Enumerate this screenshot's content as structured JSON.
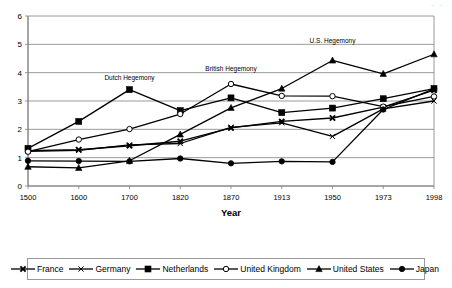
{
  "top_partial_text": "‥ ‥",
  "chart_data": {
    "type": "line",
    "title": "",
    "xlabel": "Year",
    "ylabel": "",
    "categories": [
      "1500",
      "1600",
      "1700",
      "1820",
      "1870",
      "1913",
      "1950",
      "1973",
      "1998"
    ],
    "ylim": [
      0,
      6
    ],
    "yticks": [
      "0",
      "1",
      "2",
      "3",
      "4",
      "5",
      "6"
    ],
    "grid": true,
    "legend_position": "bottom",
    "annotations": [
      {
        "text": "Dutch Hegemony",
        "x": "1700",
        "y": 3.75
      },
      {
        "text": "British Hegemony",
        "x": "1870",
        "y": 4.05
      },
      {
        "text": "U.S. Hegemony",
        "x": "1950",
        "y": 5.05
      }
    ],
    "series": [
      {
        "name": "France",
        "marker": "x-bold",
        "values": [
          1.25,
          1.28,
          1.42,
          1.58,
          2.05,
          2.28,
          2.4,
          2.78,
          3.38
        ]
      },
      {
        "name": "Germany",
        "marker": "x-thin",
        "values": [
          1.22,
          1.26,
          1.45,
          1.5,
          2.07,
          2.23,
          1.75,
          2.72,
          3.0
        ]
      },
      {
        "name": "Netherlands",
        "marker": "filled-square",
        "values": [
          1.33,
          2.28,
          3.4,
          2.66,
          3.11,
          2.59,
          2.75,
          3.08,
          3.44
        ]
      },
      {
        "name": "United Kingdom",
        "marker": "open-circle",
        "values": [
          1.21,
          1.64,
          2.01,
          2.54,
          3.6,
          3.18,
          3.17,
          2.8,
          3.16
        ]
      },
      {
        "name": "United States",
        "marker": "filled-triangle",
        "values": [
          0.68,
          0.64,
          0.89,
          1.82,
          2.76,
          3.44,
          4.43,
          3.96,
          4.65
        ]
      },
      {
        "name": "Japan",
        "marker": "filled-circle",
        "values": [
          0.89,
          0.88,
          0.87,
          0.97,
          0.8,
          0.87,
          0.85,
          2.7,
          3.43
        ]
      }
    ]
  },
  "legend": {
    "items": [
      {
        "label": "France",
        "marker": "x-bold"
      },
      {
        "label": "Germany",
        "marker": "x-thin"
      },
      {
        "label": "Netherlands",
        "marker": "filled-square"
      },
      {
        "label": "United Kingdom",
        "marker": "open-circle"
      },
      {
        "label": "United States",
        "marker": "filled-triangle"
      },
      {
        "label": "Japan",
        "marker": "filled-circle"
      }
    ]
  },
  "colors": {
    "line": "#000000",
    "grid": "#808080",
    "axis": "#808080",
    "text": "#000000",
    "background": "#ffffff"
  }
}
